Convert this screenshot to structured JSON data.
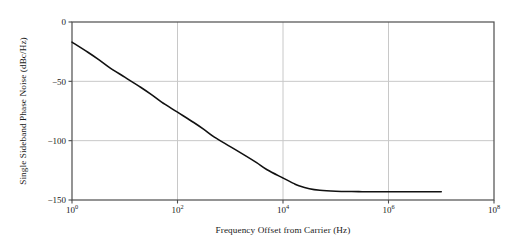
{
  "chart_data": {
    "type": "line",
    "title": "",
    "xlabel": "Frequency Offset from Carrier (Hz)",
    "ylabel": "Single Sideband Phase Noise (dBc/Hz)",
    "xscale": "log",
    "yscale": "linear",
    "xlim": [
      1,
      100000000
    ],
    "ylim": [
      -150,
      0
    ],
    "grid": true,
    "legend": null,
    "xticks": [
      1,
      100,
      10000,
      1000000,
      100000000
    ],
    "xtick_labels": [
      "10^0",
      "10^2",
      "10^4",
      "10^6",
      "10^8"
    ],
    "xtick_mantissas": [
      "10",
      "10",
      "10",
      "10",
      "10"
    ],
    "xtick_exponents": [
      "0",
      "2",
      "4",
      "6",
      "8"
    ],
    "yticks": [
      0,
      -50,
      -100,
      -150
    ],
    "ytick_labels": [
      "0",
      "−50",
      "−100",
      "−150"
    ],
    "series": [
      {
        "name": "Single Sideband Phase Noise",
        "color": "#111111",
        "linewidth": 1.6,
        "x": [
          1,
          2,
          3.16,
          5,
          10,
          20,
          31.6,
          50,
          100,
          200,
          316,
          500,
          1000,
          2000,
          3160,
          5000,
          10000,
          15800,
          20000,
          31600,
          50000,
          100000,
          200000,
          316000,
          500000,
          1000000,
          2000000,
          3160000,
          5000000,
          8000000,
          10000000
        ],
        "y": [
          -17.0,
          -25.5,
          -31.5,
          -38.0,
          -46.5,
          -55.0,
          -61.0,
          -67.5,
          -76.0,
          -84.5,
          -90.5,
          -97.0,
          -105.0,
          -113.0,
          -118.5,
          -124.5,
          -131.5,
          -136.0,
          -138.0,
          -140.5,
          -141.8,
          -142.6,
          -142.9,
          -143.0,
          -143.0,
          -143.0,
          -143.0,
          -143.0,
          -143.0,
          -143.0,
          -143.0
        ]
      }
    ],
    "annotations": [],
    "notes": {
      "plateau_value": -143,
      "initial_value": -17,
      "slope_db_per_decade": -28.5,
      "curve_end_x": 10000000
    }
  },
  "figure": {
    "background": "#ffffff",
    "axes_color": "#4d4d4d",
    "grid_color": "#c8c8c8",
    "text_color": "#1a1a1a"
  }
}
